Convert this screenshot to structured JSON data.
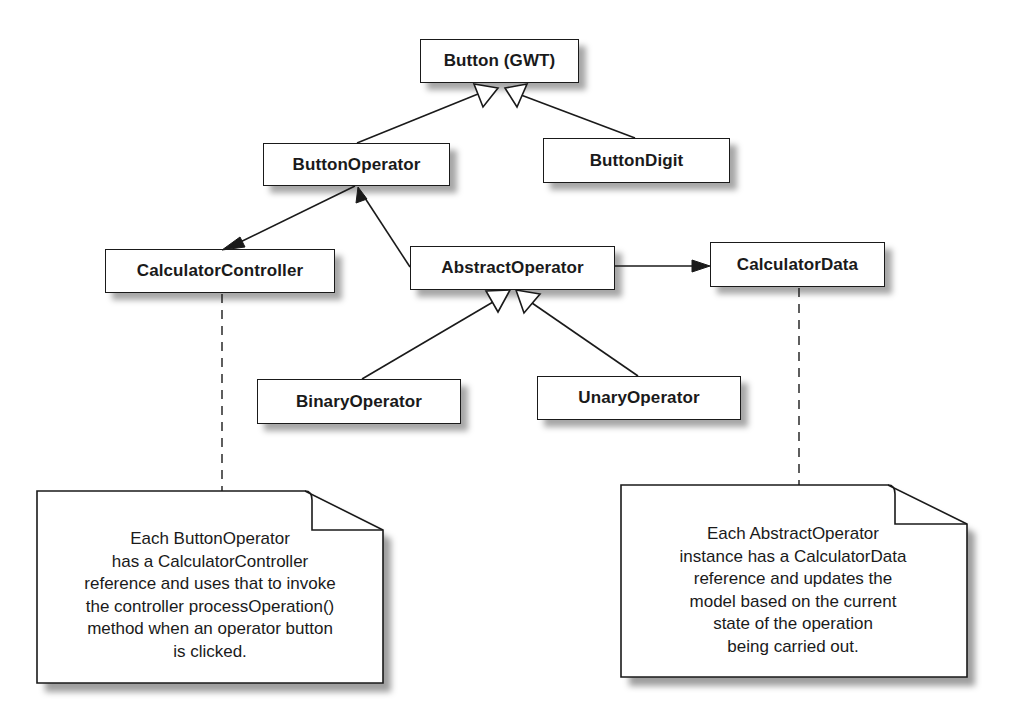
{
  "diagram": {
    "type": "UML class diagram",
    "classes": {
      "button_gwt": {
        "label": "Button (GWT)"
      },
      "button_operator": {
        "label": "ButtonOperator"
      },
      "button_digit": {
        "label": "ButtonDigit"
      },
      "calculator_controller": {
        "label": "CalculatorController"
      },
      "abstract_operator": {
        "label": "AbstractOperator"
      },
      "calculator_data": {
        "label": "CalculatorData"
      },
      "binary_operator": {
        "label": "BinaryOperator"
      },
      "unary_operator": {
        "label": "UnaryOperator"
      }
    },
    "relationships": [
      {
        "from": "ButtonOperator",
        "to": "Button (GWT)",
        "kind": "generalization"
      },
      {
        "from": "ButtonDigit",
        "to": "Button (GWT)",
        "kind": "generalization"
      },
      {
        "from": "ButtonOperator",
        "to": "CalculatorController",
        "kind": "association"
      },
      {
        "from": "AbstractOperator",
        "to": "ButtonOperator",
        "kind": "association"
      },
      {
        "from": "AbstractOperator",
        "to": "CalculatorData",
        "kind": "association"
      },
      {
        "from": "BinaryOperator",
        "to": "AbstractOperator",
        "kind": "generalization"
      },
      {
        "from": "UnaryOperator",
        "to": "AbstractOperator",
        "kind": "generalization"
      }
    ],
    "notes": {
      "controller_note": {
        "attached_to": "CalculatorController",
        "lines": [
          "Each ButtonOperator",
          "has a CalculatorController",
          "reference and uses that to invoke",
          "the controller processOperation()",
          "method when an operator button",
          "is clicked."
        ]
      },
      "data_note": {
        "attached_to": "CalculatorData",
        "lines": [
          "Each AbstractOperator",
          "instance has a CalculatorData",
          "reference and updates the",
          "model based on the current",
          "state of the operation",
          "being carried out."
        ]
      }
    },
    "colors": {
      "line": "#1a1a1a",
      "box_fill": "#ffffff",
      "shadow": "#8a8a8a",
      "background": "#ffffff"
    }
  }
}
